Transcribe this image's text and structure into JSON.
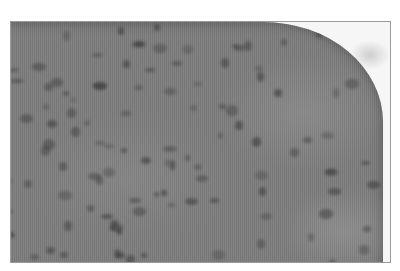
{
  "image": {
    "type": "grayscale micrograph",
    "subject": "tissue section with scattered dark nuclei",
    "colors": {
      "background": "#ffffff",
      "frame_border": "#9a9a9a",
      "tissue": "#7d7d7d",
      "nuclei": "#3a3a3a"
    }
  }
}
